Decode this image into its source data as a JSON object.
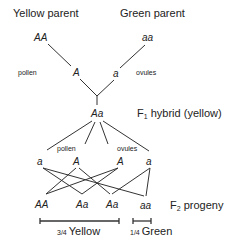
{
  "parents": {
    "yellow_label": "Yellow parent",
    "green_label": "Green parent",
    "yellow_genotype": "AA",
    "green_genotype": "aa"
  },
  "p_gametes": {
    "pollen_label": "pollen",
    "ovules_label": "ovules",
    "pollen_allele": "A",
    "ovule_allele": "a"
  },
  "f1": {
    "genotype": "Aa",
    "label_prefix": "F",
    "label_sub": "1",
    "label_suffix": " hybrid (yellow)"
  },
  "f1_gametes": {
    "pollen_label": "pollen",
    "ovules_label": "ovules",
    "alleles": [
      "a",
      "A",
      "A",
      "a"
    ]
  },
  "f2": {
    "genotypes": [
      "AA",
      "Aa",
      "Aa",
      "aa"
    ],
    "label_prefix": "F",
    "label_sub": "2",
    "label_suffix": " progeny"
  },
  "ratios": {
    "yellow": "3/4 Yellow",
    "yellow_frac": "3/4",
    "yellow_word": "Yellow",
    "green_frac": "1/4",
    "green_word": "Green"
  },
  "colors": {
    "line": "#333333",
    "text": "#222222"
  }
}
